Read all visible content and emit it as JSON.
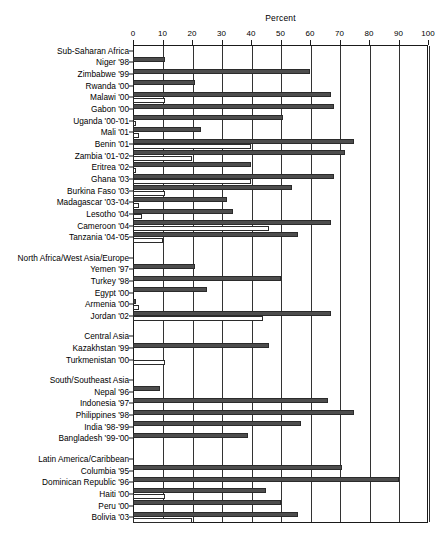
{
  "chart_data": {
    "type": "bar",
    "title": "Percent",
    "xlabel": "Percent",
    "ylabel": "",
    "xlim": [
      0,
      100
    ],
    "xticks": [
      0,
      10,
      20,
      30,
      40,
      50,
      60,
      70,
      80,
      90,
      100
    ],
    "grid": true,
    "orientation": "horizontal",
    "legend_position": "none",
    "series": [
      {
        "name": "filled",
        "style": "filled"
      },
      {
        "name": "hollow",
        "style": "hollow"
      }
    ],
    "groups": [
      {
        "group_label": "Sub-Saharan Africa",
        "rows": [
          {
            "category": "Niger '98",
            "filled": 11,
            "hollow": 0
          },
          {
            "category": "Zimbabwe '99",
            "filled": 60,
            "hollow": 0
          },
          {
            "category": "Rwanda '00",
            "filled": 21,
            "hollow": 0
          },
          {
            "category": "Malawi '00",
            "filled": 67,
            "hollow": 11
          },
          {
            "category": "Gabon '00",
            "filled": 68,
            "hollow": 0
          },
          {
            "category": "Uganda '00-'01",
            "filled": 51,
            "hollow": 1
          },
          {
            "category": "Mali '01",
            "filled": 23,
            "hollow": 2
          },
          {
            "category": "Benin '01",
            "filled": 75,
            "hollow": 40
          },
          {
            "category": "Zambia '01-'02",
            "filled": 72,
            "hollow": 20
          },
          {
            "category": "Eritrea '02",
            "filled": 40,
            "hollow": 1
          },
          {
            "category": "Ghana '03",
            "filled": 68,
            "hollow": 40
          },
          {
            "category": "Burkina Faso '03",
            "filled": 54,
            "hollow": 11
          },
          {
            "category": "Madagascar '03-'04",
            "filled": 32,
            "hollow": 2
          },
          {
            "category": "Lesotho '04",
            "filled": 34,
            "hollow": 3
          },
          {
            "category": "Cameroon '04",
            "filled": 67,
            "hollow": 46
          },
          {
            "category": "Tanzania '04-'05",
            "filled": 56,
            "hollow": 10
          }
        ]
      },
      {
        "group_label": "North Africa/West Asia/Europe",
        "rows": [
          {
            "category": "Yemen '97",
            "filled": 21,
            "hollow": 0
          },
          {
            "category": "Turkey '98",
            "filled": 50,
            "hollow": 0
          },
          {
            "category": "Egypt '00",
            "filled": 25,
            "hollow": 0
          },
          {
            "category": "Armenia '00",
            "filled": 1,
            "hollow": 2
          },
          {
            "category": "Jordan '02",
            "filled": 67,
            "hollow": 44
          }
        ]
      },
      {
        "group_label": "Central Asia",
        "rows": [
          {
            "category": "Kazakhstan '99",
            "filled": 46,
            "hollow": 0
          },
          {
            "category": "Turkmenistan '00",
            "filled": 0,
            "hollow": 11
          }
        ]
      },
      {
        "group_label": "South/Southeast Asia",
        "rows": [
          {
            "category": "Nepal '96",
            "filled": 9,
            "hollow": 0
          },
          {
            "category": "Indonesia '97",
            "filled": 66,
            "hollow": 0
          },
          {
            "category": "Philippines '98",
            "filled": 75,
            "hollow": 0
          },
          {
            "category": "India '98-'99",
            "filled": 57,
            "hollow": 0
          },
          {
            "category": "Bangladesh '99-'00",
            "filled": 39,
            "hollow": 0
          }
        ]
      },
      {
        "group_label": "Latin America/Caribbean",
        "rows": [
          {
            "category": "Columbia '95",
            "filled": 71,
            "hollow": 0
          },
          {
            "category": "Dominican Republic '96",
            "filled": 90,
            "hollow": 0
          },
          {
            "category": "Haiti '00",
            "filled": 45,
            "hollow": 11
          },
          {
            "category": "Peru '00",
            "filled": 50,
            "hollow": 0
          },
          {
            "category": "Bolivia '03",
            "filled": 56,
            "hollow": 20
          }
        ]
      }
    ]
  }
}
